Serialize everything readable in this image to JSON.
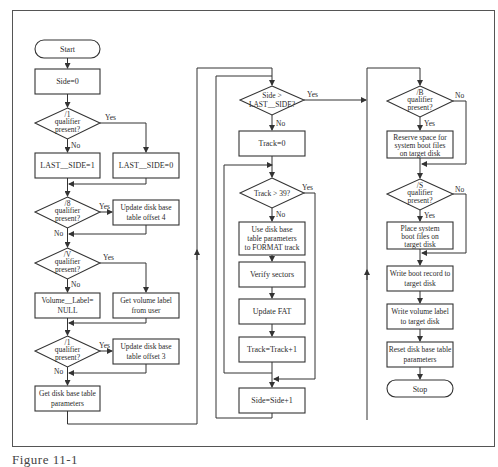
{
  "caption": "Figure 11-1",
  "nodes": {
    "start": "Start",
    "side0": "Side=0",
    "q1": [
      "/1",
      "qualifier",
      "present?"
    ],
    "last1": "LAST__SIDE=1",
    "last0": "LAST__SIDE=0",
    "q8": [
      "/8",
      "qualifier",
      "present?"
    ],
    "upd4": [
      "Update disk base",
      "table offset 4"
    ],
    "qv": [
      "/V",
      "qualifier",
      "present?"
    ],
    "volnull": [
      "Volume__Label=",
      "NULL"
    ],
    "getvol": [
      "Get volume label",
      "from user"
    ],
    "q1b": [
      "/1",
      "qualifier",
      "present?"
    ],
    "upd3": [
      "Update disk base",
      "table offset 3"
    ],
    "getparams": [
      "Get disk base table",
      "parameters"
    ],
    "qside": [
      "Side >",
      "LAST__SIDE?"
    ],
    "track0": "Track=0",
    "qtrack": "Track > 39?",
    "usedisk": [
      "Use disk base",
      "table parameters",
      "to FORMAT track"
    ],
    "verify": "Verify sectors",
    "updfat": "Update FAT",
    "trackinc": "Track=Track+1",
    "sideinc": "Side=Side+1",
    "qb": [
      "/B",
      "qualifier",
      "present?"
    ],
    "reserve": [
      "Reserve space for",
      "system boot files",
      "on target disk"
    ],
    "qs": [
      "/S",
      "qualifier",
      "present?"
    ],
    "place": [
      "Place system",
      "boot files on",
      "target disk"
    ],
    "writeboot": [
      "Write boot record to",
      "target disk"
    ],
    "writevol": [
      "Write volume label",
      "to target disk"
    ],
    "reset": [
      "Reset disk base table",
      "parameters"
    ],
    "stop": "Stop"
  },
  "labels": {
    "yes": "Yes",
    "no": "No"
  }
}
